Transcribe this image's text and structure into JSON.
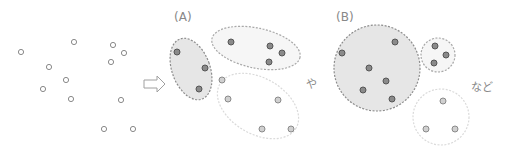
{
  "diagram": {
    "type": "clustering-illustration",
    "labels": {
      "option_a": "(A)",
      "option_b": "(B)",
      "separator": "や",
      "ending": "など"
    },
    "arrow_icon": "right-arrow-outline",
    "colors": {
      "unclustered_point_stroke": "#8a8a8a",
      "clustered_point_fill": "#8a8a8a",
      "clustered_point_stroke": "#555555",
      "light_point_fill": "#d0d0d0",
      "dark_cluster_fill": "#e6e6e6",
      "dark_cluster_stroke": "#8c8c8c",
      "light_cluster_fill": "#f6f6f6",
      "light_cluster_stroke": "#a8a8a8",
      "faint_cluster_stroke": "#dadada",
      "text": "#888888"
    },
    "raw_points": {
      "count": 12,
      "style": "hollow"
    },
    "clusterings": [
      {
        "name": "A",
        "clusters": [
          {
            "shape": "ellipse",
            "style": "dark",
            "points": 3
          },
          {
            "shape": "ellipse",
            "style": "light",
            "points": 4
          },
          {
            "shape": "ellipse",
            "style": "faint",
            "points": 5
          }
        ]
      },
      {
        "name": "B",
        "clusters": [
          {
            "shape": "circle",
            "style": "dark",
            "points": 6
          },
          {
            "shape": "circle",
            "style": "light",
            "points": 3
          },
          {
            "shape": "circle",
            "style": "faint",
            "points": 3
          }
        ]
      }
    ]
  }
}
